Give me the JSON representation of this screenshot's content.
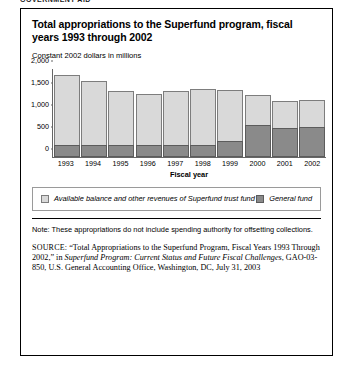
{
  "running_head": "GOVERNMENT AID",
  "figure": {
    "title": "Total appropriations to the Superfund program, fiscal years 1993 through 2002",
    "subtitle": "Constant 2002 dollars in millions",
    "note": "Note: These appropriations do not include spending authority for offsetting collections.",
    "source": {
      "tag": "SOURCE:",
      "quoted_title": "“Total Appropriations to the Superfund Program, Fiscal Years 1993 Through 2002,”",
      "in_word": "in",
      "publication": "Superfund Program: Current Status and Future Fiscal Challenges",
      "rest": ", GAO-03-850, U.S. General Accounting Office, Washington, DC, July 31, 2003"
    }
  },
  "chart_data": {
    "type": "bar",
    "subtype": "stacked",
    "title": "Total appropriations to the Superfund program, fiscal years 1993 through 2002",
    "xlabel": "Fiscal year",
    "ylabel": "Constant 2002 dollars in millions",
    "ylim": [
      0,
      2000
    ],
    "yticks": [
      0,
      500,
      1000,
      1500,
      2000
    ],
    "ytick_labels": [
      "0",
      "500",
      "1,000",
      "1,500",
      "2,000"
    ],
    "grid": false,
    "legend_position": "below",
    "categories": [
      "1993",
      "1994",
      "1995",
      "1996",
      "1997",
      "1998",
      "1999",
      "2000",
      "2001",
      "2002"
    ],
    "series": [
      {
        "name": "General fund",
        "color": "#8a8a8a",
        "values": [
          270,
          270,
          270,
          265,
          265,
          270,
          370,
          720,
          660,
          680
        ]
      },
      {
        "name": "Available balance and other revenues of Superfund trust fund",
        "color": "#d9d9d9",
        "values": [
          1590,
          1450,
          1240,
          1165,
          1235,
          1280,
          1150,
          680,
          610,
          620
        ]
      }
    ],
    "totals": [
      1860,
      1720,
      1510,
      1430,
      1500,
      1550,
      1520,
      1400,
      1270,
      1300
    ]
  },
  "legend": {
    "items": [
      {
        "label": "Available balance and other revenues of Superfund trust fund",
        "color": "#d9d9d9"
      },
      {
        "label": "General fund",
        "color": "#8a8a8a"
      }
    ]
  }
}
